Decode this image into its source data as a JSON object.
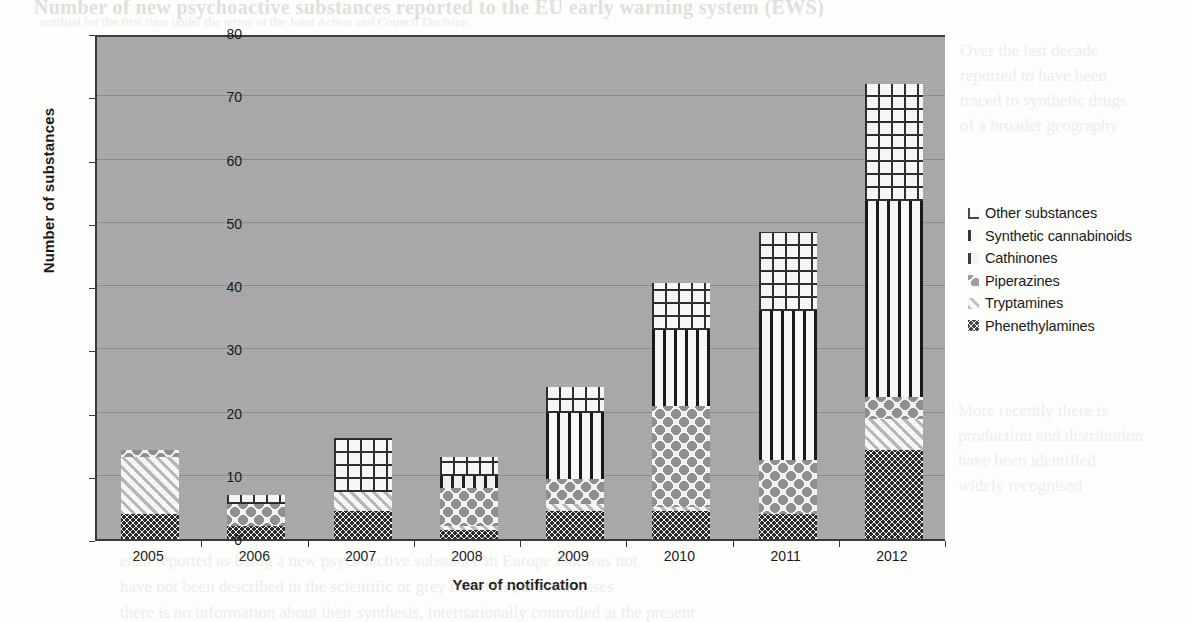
{
  "chart_data": {
    "type": "bar",
    "subtype": "stacked-column",
    "title": "",
    "xlabel": "Year of notification",
    "ylabel": "Number of substances",
    "ylim": [
      0,
      80
    ],
    "ytick_step": 10,
    "yticks": [
      80,
      70,
      60,
      50,
      40,
      30,
      20,
      10,
      0
    ],
    "grid": true,
    "legend_position": "right",
    "categories": [
      "2005",
      "2006",
      "2007",
      "2008",
      "2009",
      "2010",
      "2011",
      "2012"
    ],
    "series": [
      {
        "name": "Phenethylamines",
        "pattern": "fine-speckle",
        "values": [
          4,
          2,
          4.5,
          1.5,
          4.5,
          4.5,
          4,
          14
        ]
      },
      {
        "name": "Tryptamines",
        "pattern": "diagonal-hatch",
        "values": [
          9,
          0,
          3,
          0.5,
          1,
          0.5,
          0,
          5
        ]
      },
      {
        "name": "Piperazines",
        "pattern": "grey-dots",
        "values": [
          1,
          3.5,
          0,
          6,
          4,
          16,
          8.5,
          3.5
        ]
      },
      {
        "name": "Cathinones",
        "pattern": "short-ticks",
        "values": [
          0,
          0,
          0,
          2,
          0,
          0,
          0,
          0
        ]
      },
      {
        "name": "Synthetic cannabinoids",
        "pattern": "vertical-bars",
        "values": [
          0,
          0,
          0,
          0,
          10.5,
          12,
          23.5,
          31
        ]
      },
      {
        "name": "Other substances",
        "pattern": "grid-crosshatch",
        "values": [
          0,
          1.5,
          8.5,
          3,
          4,
          7.5,
          12.5,
          18.5
        ]
      }
    ],
    "totals": [
      14,
      7,
      16,
      13,
      24,
      40.5,
      48.5,
      72
    ],
    "legend_entries": [
      "Other substances",
      "Synthetic cannabinoids",
      "Cathinones",
      "Piperazines",
      "Tryptamines",
      "Phenethylamines"
    ]
  },
  "page_bleed": {
    "line1": "Number of new psychoactive substances reported to the EU early warning system (EWS)",
    "line2": "notified for the first time under the terms of the Joint Action and Council Decision",
    "right_block_top": "Over the last decade\nreported to have been\ntraced to synthetic drugs\nof a broader geography",
    "right_block_bottom": "More recently there is\nproduction and distribution\nhave been identified\nwidely recognised",
    "bottom_block": "each reported as being a new psychoactive substance in Europe that was not\nhave not been described in the scientific or grey literature; in some cases\nthere is no information about their synthesis, internationally controlled at the present"
  }
}
